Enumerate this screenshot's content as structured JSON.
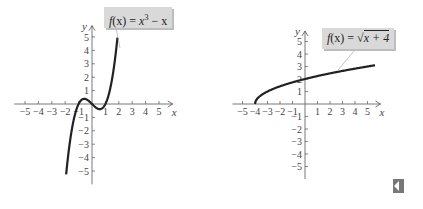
{
  "chart_data": [
    {
      "type": "line",
      "title": "f(x) = x^3 - x",
      "label": "f(x) = x³ − x",
      "xlabel": "x",
      "ylabel": "y",
      "xlim": [
        -5.8,
        5.8
      ],
      "ylim": [
        -6,
        6
      ],
      "x_ticks": [
        -5,
        -4,
        -3,
        -2,
        -1,
        1,
        2,
        3,
        4,
        5
      ],
      "y_ticks": [
        -5,
        -4,
        -3,
        -2,
        -1,
        1,
        2,
        3,
        4,
        5
      ],
      "grid": false,
      "function": "x^3 - x",
      "domain_plotted": [
        -1.93,
        1.9
      ],
      "x": [
        -1.93,
        -1.5,
        -1.0,
        -0.577,
        0,
        0.577,
        1.0,
        1.5,
        1.9
      ],
      "y": [
        -5.26,
        -1.88,
        0,
        0.385,
        0,
        -0.385,
        0,
        1.88,
        4.96
      ]
    },
    {
      "type": "line",
      "title": "f(x) = sqrt(x + 4)",
      "label": "f(x) = √(x + 4)",
      "xlabel": "x",
      "ylabel": "y",
      "xlim": [
        -5.8,
        5.8
      ],
      "ylim": [
        -6,
        6
      ],
      "x_ticks": [
        -5,
        -4,
        -3,
        -2,
        -1,
        1,
        2,
        3,
        4,
        5
      ],
      "y_ticks": [
        -5,
        -4,
        -3,
        -2,
        -1,
        1,
        2,
        3,
        4,
        5
      ],
      "grid": false,
      "function": "sqrt(x + 4)",
      "domain_plotted": [
        -4,
        5.6
      ],
      "x": [
        -4,
        -3,
        -2,
        -1,
        0,
        1,
        2,
        3,
        4,
        5,
        5.6
      ],
      "y": [
        0,
        1,
        1.41,
        1.73,
        2,
        2.24,
        2.45,
        2.65,
        2.83,
        3,
        3.1
      ]
    }
  ],
  "labels": {
    "left_func": "x",
    "left_exp": "3",
    "left_tail": " − x",
    "right_func": "x + 4",
    "fx": "f",
    "paren": "(x) = ",
    "x_axis": "x",
    "y_axis": "y"
  },
  "colors": {
    "curve": "#222222",
    "axis": "#555555",
    "label_bg": "#d9d9d9",
    "nav_icon": "#777777"
  },
  "nav": {
    "icon": "previous-page-icon"
  }
}
